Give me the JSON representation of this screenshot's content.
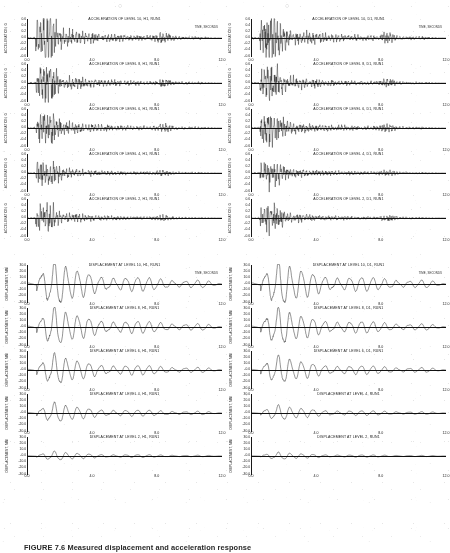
{
  "document": {
    "caption": "FIGURE 7.6  Measured displacement and acceleration response",
    "top_marks": [
      "○",
      "○"
    ]
  },
  "axes": {
    "time_annotation": "TIME, SECONDS",
    "x_ticks": [
      "0.0",
      "4.0",
      "8.0",
      "12.0"
    ],
    "x_tick_positions": [
      0,
      33.3,
      66.6,
      100
    ],
    "acceleration_ylabel": "ACCELERATION, G",
    "acceleration_yticks": [
      "0.6",
      "0.4",
      "0.2",
      "0.0",
      "-0.2",
      "-0.4",
      "-0.6"
    ],
    "displacement_ylabel": "DISPLACEMENT, MM",
    "displacement_yticks": [
      "30.0",
      "20.0",
      "10.0",
      "-0.0",
      "-10.0",
      "-20.0",
      "-30.0"
    ]
  },
  "columns": {
    "left": {
      "acceleration": [
        {
          "title": "ACCELERATION OF LEVEL 10, H1, RUN1",
          "level": 10,
          "channel": "H1",
          "run": "RUN1",
          "show_time_label": true,
          "envelope": "heavy-burst",
          "seed": 11
        },
        {
          "title": "ACCELERATION OF LEVEL 8, H1, RUN1",
          "level": 8,
          "channel": "H1",
          "run": "RUN1",
          "show_time_label": false,
          "envelope": "medium-burst",
          "seed": 23
        },
        {
          "title": "ACCELERATION OF LEVEL 6, H1, RUN1",
          "level": 6,
          "channel": "H1",
          "run": "RUN1",
          "show_time_label": false,
          "envelope": "medium-burst",
          "seed": 37
        },
        {
          "title": "ACCELERATION OF LEVEL 4, H1, RUN1",
          "level": 4,
          "channel": "H1",
          "run": "RUN1",
          "show_time_label": false,
          "envelope": "light-burst",
          "seed": 41
        },
        {
          "title": "ACCELERATION OF LEVEL 2, H1, RUN1",
          "level": 2,
          "channel": "H1",
          "run": "RUN1",
          "show_time_label": false,
          "envelope": "light-burst",
          "seed": 53
        }
      ],
      "displacement": [
        {
          "title": "DISPLACEMENT AT LEVEL 10, H1, RUN1",
          "level": 10,
          "channel": "H1",
          "run": "RUN1",
          "show_time_label": true,
          "amplitude": 1.0,
          "seed": 61
        },
        {
          "title": "DISPLACEMENT AT LEVEL 8, H1, RUN1",
          "level": 8,
          "channel": "H1",
          "run": "RUN1",
          "show_time_label": false,
          "amplitude": 0.86,
          "seed": 67
        },
        {
          "title": "DISPLACEMENT AT LEVEL 6, H1, RUN1",
          "level": 6,
          "channel": "H1",
          "run": "RUN1",
          "show_time_label": false,
          "amplitude": 0.68,
          "seed": 71
        },
        {
          "title": "DISPLACEMENT AT LEVEL 4, H1, RUN1",
          "level": 4,
          "channel": "H1",
          "run": "RUN1",
          "show_time_label": false,
          "amplitude": 0.44,
          "seed": 79
        },
        {
          "title": "DISPLACEMENT AT LEVEL 2, H1, RUN1",
          "level": 2,
          "channel": "H1",
          "run": "RUN1",
          "show_time_label": false,
          "amplitude": 0.2,
          "seed": 83
        }
      ]
    },
    "right": {
      "acceleration": [
        {
          "title": "ACCELERATION OF LEVEL 10, D1, RUN1",
          "level": 10,
          "channel": "D1",
          "run": "RUN1",
          "show_time_label": true,
          "envelope": "heavy-burst",
          "seed": 97
        },
        {
          "title": "ACCELERATION OF LEVEL 8, D1, RUN1",
          "level": 8,
          "channel": "D1",
          "run": "RUN1",
          "show_time_label": false,
          "envelope": "medium-burst",
          "seed": 101
        },
        {
          "title": "ACCELERATION OF LEVEL 6, D1, RUN1",
          "level": 6,
          "channel": "D1",
          "run": "RUN1",
          "show_time_label": false,
          "envelope": "medium-burst",
          "seed": 103
        },
        {
          "title": "ACCELERATION OF LEVEL 4, D1, RUN1",
          "level": 4,
          "channel": "D1",
          "run": "RUN1",
          "show_time_label": false,
          "envelope": "light-burst",
          "seed": 107
        },
        {
          "title": "ACCELERATION OF LEVEL 2, D1, RUN1",
          "level": 2,
          "channel": "D1",
          "run": "RUN1",
          "show_time_label": false,
          "envelope": "light-burst",
          "seed": 109
        }
      ],
      "displacement": [
        {
          "title": "DISPLACEMENT AT LEVEL 10, D1, RUN1",
          "level": 10,
          "channel": "D1",
          "run": "RUN1",
          "show_time_label": true,
          "amplitude": 1.0,
          "seed": 113
        },
        {
          "title": "DISPLACEMENT AT LEVEL 8, D1, RUN1",
          "level": 8,
          "channel": "D1",
          "run": "RUN1",
          "show_time_label": false,
          "amplitude": 0.82,
          "seed": 127
        },
        {
          "title": "DISPLACEMENT AT LEVEL 6, D1, RUN1",
          "level": 6,
          "channel": "D1",
          "run": "RUN1",
          "show_time_label": false,
          "amplitude": 0.62,
          "seed": 131
        },
        {
          "title": "DISPLACEMENT AT LEVEL 4, RUN1",
          "level": 4,
          "channel": "",
          "run": "RUN1",
          "show_time_label": false,
          "amplitude": 0.34,
          "seed": 137
        },
        {
          "title": "DISPLACEMENT AT LEVEL 2, RUN1",
          "level": 2,
          "channel": "",
          "run": "RUN1",
          "show_time_label": false,
          "amplitude": 0.16,
          "seed": 139
        }
      ]
    }
  },
  "chart_data": {
    "type": "line",
    "xlabel": "TIME, SECONDS",
    "xlim": [
      0.0,
      12.0
    ],
    "xticks": [
      0.0,
      4.0,
      8.0,
      12.0
    ],
    "grid": false,
    "legend": "none",
    "panel_count": 20,
    "groups": [
      {
        "group": "acceleration-H1",
        "column": "left",
        "ylabel": "ACCELERATION, G",
        "ylim": [
          -0.6,
          0.6
        ],
        "yticks": [
          0.6,
          0.4,
          0.2,
          0.0,
          -0.2,
          -0.4,
          -0.6
        ],
        "series": [
          {
            "name": "ACCELERATION OF LEVEL 10, H1, RUN1",
            "level": 10,
            "peak_g": 0.58
          },
          {
            "name": "ACCELERATION OF LEVEL 8, H1, RUN1",
            "level": 8,
            "peak_g": 0.42
          },
          {
            "name": "ACCELERATION OF LEVEL 6, H1, RUN1",
            "level": 6,
            "peak_g": 0.46
          },
          {
            "name": "ACCELERATION OF LEVEL 4, H1, RUN1",
            "level": 4,
            "peak_g": 0.26
          },
          {
            "name": "ACCELERATION OF LEVEL 2, H1, RUN1",
            "level": 2,
            "peak_g": 0.22
          }
        ]
      },
      {
        "group": "acceleration-D1",
        "column": "right",
        "ylabel": "ACCELERATION, G",
        "ylim": [
          -0.6,
          0.6
        ],
        "yticks": [
          0.6,
          0.4,
          0.2,
          0.0,
          -0.2,
          -0.4,
          -0.6
        ],
        "series": [
          {
            "name": "ACCELERATION OF LEVEL 10, D1, RUN1",
            "level": 10,
            "peak_g": 0.55
          },
          {
            "name": "ACCELERATION OF LEVEL 8, D1, RUN1",
            "level": 8,
            "peak_g": 0.4
          },
          {
            "name": "ACCELERATION OF LEVEL 6, D1, RUN1",
            "level": 6,
            "peak_g": 0.48
          },
          {
            "name": "ACCELERATION OF LEVEL 4, D1, RUN1",
            "level": 4,
            "peak_g": 0.3
          },
          {
            "name": "ACCELERATION OF LEVEL 2, D1, RUN1",
            "level": 2,
            "peak_g": 0.24
          }
        ]
      },
      {
        "group": "displacement-H1",
        "column": "left",
        "ylabel": "DISPLACEMENT, MM",
        "ylim": [
          -30.0,
          30.0
        ],
        "yticks": [
          30.0,
          20.0,
          10.0,
          -0.0,
          -10.0,
          -20.0,
          -30.0
        ],
        "series": [
          {
            "name": "DISPLACEMENT AT LEVEL 10, H1, RUN1",
            "level": 10,
            "peak_mm": 28.0
          },
          {
            "name": "DISPLACEMENT AT LEVEL 8, H1, RUN1",
            "level": 8,
            "peak_mm": 24.0
          },
          {
            "name": "DISPLACEMENT AT LEVEL 6, H1, RUN1",
            "level": 6,
            "peak_mm": 19.0
          },
          {
            "name": "DISPLACEMENT AT LEVEL 4, H1, RUN1",
            "level": 4,
            "peak_mm": 12.0
          },
          {
            "name": "DISPLACEMENT AT LEVEL 2, H1, RUN1",
            "level": 2,
            "peak_mm": 6.0
          }
        ]
      },
      {
        "group": "displacement-D1",
        "column": "right",
        "ylabel": "DISPLACEMENT, MM",
        "ylim": [
          -30.0,
          30.0
        ],
        "yticks": [
          30.0,
          20.0,
          10.0,
          -0.0,
          -10.0,
          -20.0,
          -30.0
        ],
        "series": [
          {
            "name": "DISPLACEMENT AT LEVEL 10, D1, RUN1",
            "level": 10,
            "peak_mm": 28.0
          },
          {
            "name": "DISPLACEMENT AT LEVEL 8, D1, RUN1",
            "level": 8,
            "peak_mm": 23.0
          },
          {
            "name": "DISPLACEMENT AT LEVEL 6, D1, RUN1",
            "level": 6,
            "peak_mm": 17.0
          },
          {
            "name": "DISPLACEMENT AT LEVEL 4, RUN1",
            "level": 4,
            "peak_mm": 9.5
          },
          {
            "name": "DISPLACEMENT AT LEVEL 2, RUN1",
            "level": 2,
            "peak_mm": 4.5
          }
        ]
      }
    ]
  }
}
